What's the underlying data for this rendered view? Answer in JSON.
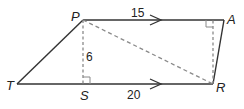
{
  "diagram": {
    "type": "trapezoid",
    "colors": {
      "stroke": "#333333",
      "dashed": "#8a8a8a",
      "background": "#ffffff"
    },
    "vertices": [
      {
        "id": "P",
        "label": "P",
        "x": 83,
        "y": 20
      },
      {
        "id": "A",
        "label": "A",
        "x": 224,
        "y": 20
      },
      {
        "id": "R",
        "label": "R",
        "x": 213,
        "y": 84
      },
      {
        "id": "T",
        "label": "T",
        "x": 17,
        "y": 84
      },
      {
        "id": "S",
        "label": "S",
        "x": 83,
        "y": 84
      }
    ],
    "measurements": {
      "PA": "15",
      "TR": "20",
      "PS": "6"
    },
    "segments": [
      {
        "from": "P",
        "to": "A",
        "style": "solid",
        "parallel_arrow": true
      },
      {
        "from": "T",
        "to": "R",
        "style": "solid",
        "parallel_arrow": true
      },
      {
        "from": "T",
        "to": "P",
        "style": "solid"
      },
      {
        "from": "A",
        "to": "R",
        "style": "solid"
      },
      {
        "from": "P",
        "to": "S",
        "style": "dashed",
        "right_angle_at": "S"
      },
      {
        "from": "P",
        "to": "R",
        "style": "dashed"
      },
      {
        "from": "R",
        "to": "A",
        "style": "dashed",
        "right_angle_at": "A"
      }
    ]
  }
}
